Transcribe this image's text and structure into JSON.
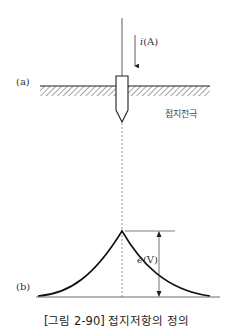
{
  "figure": {
    "caption": "[그림 2-90] 접지저항의 정의",
    "panel_a": {
      "label": "(a)",
      "current_label": "i(A)",
      "current_symbol": "i",
      "current_unit": "(A)",
      "electrode_label": "접지전극"
    },
    "panel_b": {
      "label": "(b)",
      "voltage_symbol": "e",
      "voltage_unit": "(V)"
    },
    "colors": {
      "line": "#222222",
      "hatch": "#555555",
      "dashed": "#666666"
    }
  }
}
